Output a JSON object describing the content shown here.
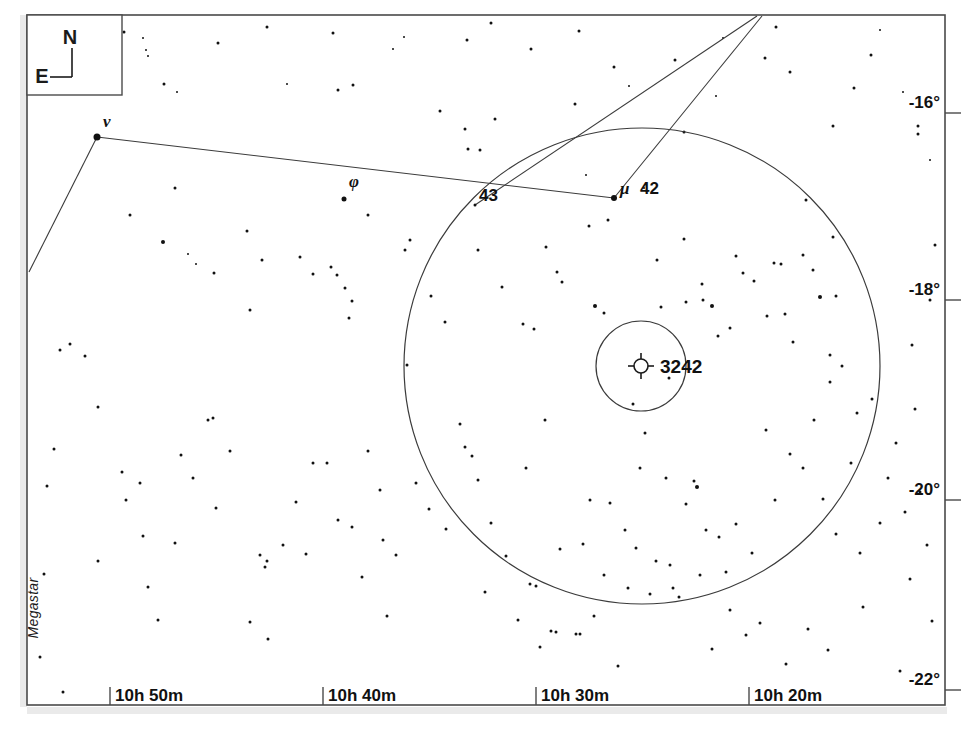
{
  "chart_data": {
    "type": "scatter",
    "title": "",
    "subtitle": "",
    "xlabel": "",
    "ylabel": "",
    "grid": false,
    "legend_position": "none",
    "projection": "equatorial star chart",
    "credit": "Megastar",
    "compass": {
      "north_label": "N",
      "east_label": "E"
    },
    "x_axis": {
      "kind": "right ascension",
      "tick_labels": [
        "10h 50m",
        "10h 40m",
        "10h 30m",
        "10h 20m"
      ],
      "tick_px": [
        110,
        323,
        536,
        749
      ],
      "range_labels": [
        "10h 55m",
        "10h 15m"
      ]
    },
    "y_axis": {
      "kind": "declination",
      "tick_labels": [
        "-16°",
        "-18°",
        "-20°",
        "-22°"
      ],
      "tick_px": [
        113,
        300,
        500,
        690
      ],
      "range_labels": [
        "-15°",
        "-22°"
      ]
    },
    "frame_px": {
      "left": 27,
      "top": 15,
      "right": 945,
      "bottom": 705
    },
    "labeled_objects": [
      {
        "label": "ν",
        "name": "nu",
        "x": 97,
        "y": 137,
        "size": 7,
        "label_dx": 6,
        "label_dy": -10,
        "font_size": 17,
        "italic": true
      },
      {
        "label": "φ",
        "name": "phi",
        "x": 344,
        "y": 199,
        "size": 5,
        "label_dx": 5,
        "label_dy": -12,
        "font_size": 17,
        "italic": true
      },
      {
        "label": "43",
        "name": "star-43",
        "x": 475,
        "y": 205,
        "size": 3,
        "label_dx": 4,
        "label_dy": -4,
        "font_size": 17,
        "italic": false
      },
      {
        "label": "μ",
        "name": "mu",
        "x": 614,
        "y": 198,
        "size": 6,
        "label_dx": 6,
        "label_dy": -4,
        "font_size": 17,
        "italic": true
      },
      {
        "label": "42",
        "name": "star-42",
        "x": 614,
        "y": 198,
        "size": 0,
        "label_dx": 26,
        "label_dy": -4,
        "font_size": 17,
        "italic": false
      },
      {
        "label": "3242",
        "name": "ngc-3242",
        "x": 641,
        "y": 366,
        "size": 0,
        "label_dx": 19,
        "label_dy": 7,
        "font_size": 19,
        "italic": false
      }
    ],
    "deep_sky_marker": {
      "label": "3242",
      "symbol": "planetary-nebula",
      "x": 641,
      "y": 366,
      "radius": 7,
      "tick_len": 6
    },
    "field_circles": [
      {
        "name": "outer-field-circle",
        "cx": 642,
        "cy": 366,
        "r": 238
      },
      {
        "name": "inner-field-circle",
        "cx": 641,
        "cy": 366,
        "r": 45
      }
    ],
    "constellation_lines": [
      {
        "name": "nu-to-mu",
        "points": [
          [
            97,
            137
          ],
          [
            614,
            198
          ]
        ]
      },
      {
        "name": "nu-to-southwest",
        "points": [
          [
            97,
            137
          ],
          [
            29,
            272
          ]
        ]
      },
      {
        "name": "mu-to-north",
        "points": [
          [
            614,
            198
          ],
          [
            762,
            16
          ]
        ]
      },
      {
        "name": "star43-to-north",
        "points": [
          [
            475,
            205
          ],
          [
            757,
            16
          ]
        ]
      }
    ],
    "stars": [
      [
        124,
        32,
        3
      ],
      [
        143,
        38,
        2
      ],
      [
        146,
        50,
        2
      ],
      [
        148,
        56,
        2
      ],
      [
        164,
        84,
        3
      ],
      [
        177,
        92,
        2
      ],
      [
        218,
        43,
        3
      ],
      [
        267,
        27,
        3
      ],
      [
        287,
        84,
        2
      ],
      [
        333,
        33,
        3
      ],
      [
        338,
        90,
        3
      ],
      [
        353,
        85,
        3
      ],
      [
        393,
        49,
        2
      ],
      [
        404,
        37,
        2
      ],
      [
        440,
        111,
        3
      ],
      [
        467,
        40,
        3
      ],
      [
        491,
        23,
        3
      ],
      [
        531,
        49,
        3
      ],
      [
        575,
        104,
        3
      ],
      [
        579,
        31,
        3
      ],
      [
        614,
        67,
        3
      ],
      [
        629,
        86,
        2
      ],
      [
        644,
        188,
        2
      ],
      [
        675,
        60,
        3
      ],
      [
        684,
        132,
        3
      ],
      [
        716,
        96,
        2
      ],
      [
        723,
        38,
        2
      ],
      [
        765,
        58,
        3
      ],
      [
        776,
        27,
        3
      ],
      [
        790,
        72,
        3
      ],
      [
        833,
        126,
        3
      ],
      [
        854,
        88,
        3
      ],
      [
        871,
        55,
        3
      ],
      [
        880,
        30,
        2
      ],
      [
        903,
        92,
        2
      ],
      [
        918,
        126,
        3
      ],
      [
        918,
        134,
        3
      ],
      [
        930,
        160,
        2
      ],
      [
        130,
        215,
        3
      ],
      [
        163,
        242,
        4
      ],
      [
        175,
        188,
        3
      ],
      [
        188,
        254,
        2
      ],
      [
        196,
        264,
        2
      ],
      [
        214,
        273,
        3
      ],
      [
        247,
        231,
        3
      ],
      [
        250,
        310,
        3
      ],
      [
        262,
        260,
        3
      ],
      [
        300,
        257,
        3
      ],
      [
        313,
        274,
        3
      ],
      [
        331,
        267,
        3
      ],
      [
        337,
        275,
        3
      ],
      [
        345,
        288,
        3
      ],
      [
        352,
        301,
        3
      ],
      [
        349,
        318,
        3
      ],
      [
        368,
        215,
        3
      ],
      [
        405,
        250,
        3
      ],
      [
        407,
        365,
        3
      ],
      [
        410,
        240,
        3
      ],
      [
        431,
        296,
        3
      ],
      [
        445,
        322,
        3
      ],
      [
        465,
        129,
        3
      ],
      [
        468,
        149,
        3
      ],
      [
        478,
        250,
        3
      ],
      [
        480,
        150,
        3
      ],
      [
        495,
        119,
        3
      ],
      [
        502,
        287,
        3
      ],
      [
        523,
        324,
        3
      ],
      [
        534,
        329,
        3
      ],
      [
        546,
        247,
        3
      ],
      [
        557,
        272,
        3
      ],
      [
        562,
        282,
        3
      ],
      [
        586,
        175,
        2
      ],
      [
        589,
        226,
        3
      ],
      [
        595,
        306,
        4
      ],
      [
        604,
        313,
        3
      ],
      [
        608,
        220,
        3
      ],
      [
        633,
        404,
        3
      ],
      [
        657,
        260,
        3
      ],
      [
        661,
        307,
        3
      ],
      [
        669,
        378,
        3
      ],
      [
        684,
        239,
        3
      ],
      [
        686,
        302,
        3
      ],
      [
        702,
        284,
        3
      ],
      [
        703,
        300,
        3
      ],
      [
        712,
        306,
        4
      ],
      [
        718,
        336,
        3
      ],
      [
        730,
        328,
        3
      ],
      [
        736,
        256,
        3
      ],
      [
        743,
        273,
        3
      ],
      [
        754,
        281,
        3
      ],
      [
        767,
        316,
        3
      ],
      [
        774,
        263,
        3
      ],
      [
        781,
        264,
        3
      ],
      [
        785,
        314,
        3
      ],
      [
        793,
        342,
        3
      ],
      [
        803,
        255,
        3
      ],
      [
        806,
        200,
        3
      ],
      [
        813,
        270,
        3
      ],
      [
        820,
        297,
        4
      ],
      [
        830,
        355,
        3
      ],
      [
        833,
        237,
        3
      ],
      [
        836,
        296,
        3
      ],
      [
        70,
        344,
        3
      ],
      [
        85,
        356,
        3
      ],
      [
        98,
        407,
        3
      ],
      [
        122,
        472,
        3
      ],
      [
        126,
        500,
        3
      ],
      [
        140,
        483,
        3
      ],
      [
        143,
        536,
        3
      ],
      [
        148,
        587,
        3
      ],
      [
        158,
        620,
        3
      ],
      [
        175,
        543,
        3
      ],
      [
        181,
        455,
        3
      ],
      [
        193,
        478,
        3
      ],
      [
        208,
        420,
        3
      ],
      [
        213,
        418,
        3
      ],
      [
        216,
        508,
        3
      ],
      [
        230,
        451,
        3
      ],
      [
        250,
        622,
        3
      ],
      [
        260,
        555,
        3
      ],
      [
        265,
        567,
        3
      ],
      [
        267,
        561,
        3
      ],
      [
        268,
        639,
        3
      ],
      [
        283,
        545,
        3
      ],
      [
        296,
        502,
        3
      ],
      [
        306,
        554,
        3
      ],
      [
        313,
        463,
        3
      ],
      [
        327,
        463,
        3
      ],
      [
        338,
        520,
        3
      ],
      [
        352,
        527,
        3
      ],
      [
        362,
        577,
        3
      ],
      [
        368,
        451,
        3
      ],
      [
        380,
        490,
        3
      ],
      [
        383,
        540,
        3
      ],
      [
        387,
        616,
        3
      ],
      [
        396,
        555,
        3
      ],
      [
        416,
        483,
        3
      ],
      [
        429,
        509,
        3
      ],
      [
        446,
        529,
        3
      ],
      [
        460,
        424,
        3
      ],
      [
        465,
        447,
        3
      ],
      [
        472,
        456,
        3
      ],
      [
        478,
        480,
        3
      ],
      [
        485,
        592,
        3
      ],
      [
        491,
        523,
        3
      ],
      [
        506,
        556,
        3
      ],
      [
        518,
        620,
        3
      ],
      [
        526,
        468,
        3
      ],
      [
        530,
        584,
        3
      ],
      [
        536,
        586,
        3
      ],
      [
        540,
        647,
        3
      ],
      [
        545,
        420,
        3
      ],
      [
        551,
        631,
        3
      ],
      [
        556,
        632,
        3
      ],
      [
        560,
        549,
        3
      ],
      [
        576,
        634,
        3
      ],
      [
        580,
        634,
        3
      ],
      [
        583,
        544,
        3
      ],
      [
        590,
        500,
        3
      ],
      [
        594,
        616,
        3
      ],
      [
        604,
        575,
        3
      ],
      [
        610,
        503,
        3
      ],
      [
        618,
        666,
        3
      ],
      [
        625,
        530,
        3
      ],
      [
        628,
        588,
        3
      ],
      [
        636,
        548,
        3
      ],
      [
        640,
        468,
        3
      ],
      [
        645,
        433,
        3
      ],
      [
        650,
        594,
        3
      ],
      [
        656,
        561,
        3
      ],
      [
        666,
        478,
        3
      ],
      [
        670,
        565,
        3
      ],
      [
        673,
        588,
        3
      ],
      [
        679,
        597,
        3
      ],
      [
        686,
        504,
        3
      ],
      [
        694,
        481,
        3
      ],
      [
        697,
        487,
        4
      ],
      [
        700,
        575,
        3
      ],
      [
        706,
        530,
        3
      ],
      [
        712,
        649,
        3
      ],
      [
        719,
        537,
        3
      ],
      [
        726,
        572,
        3
      ],
      [
        730,
        610,
        3
      ],
      [
        736,
        524,
        3
      ],
      [
        746,
        635,
        3
      ],
      [
        752,
        553,
        3
      ],
      [
        760,
        623,
        3
      ],
      [
        766,
        430,
        3
      ],
      [
        775,
        500,
        3
      ],
      [
        786,
        664,
        3
      ],
      [
        790,
        454,
        3
      ],
      [
        803,
        468,
        3
      ],
      [
        808,
        629,
        3
      ],
      [
        814,
        420,
        3
      ],
      [
        823,
        499,
        3
      ],
      [
        828,
        650,
        3
      ],
      [
        830,
        382,
        3
      ],
      [
        836,
        534,
        3
      ],
      [
        842,
        366,
        3
      ],
      [
        851,
        463,
        3
      ],
      [
        857,
        413,
        3
      ],
      [
        860,
        553,
        3
      ],
      [
        863,
        607,
        3
      ],
      [
        872,
        399,
        3
      ],
      [
        880,
        523,
        3
      ],
      [
        888,
        478,
        3
      ],
      [
        896,
        443,
        3
      ],
      [
        900,
        671,
        3
      ],
      [
        905,
        512,
        3
      ],
      [
        910,
        579,
        3
      ],
      [
        915,
        409,
        3
      ],
      [
        920,
        492,
        3
      ],
      [
        927,
        545,
        3
      ],
      [
        932,
        621,
        3
      ],
      [
        63,
        692,
        3
      ],
      [
        40,
        657,
        3
      ],
      [
        44,
        574,
        3
      ],
      [
        47,
        486,
        3
      ],
      [
        54,
        449,
        3
      ],
      [
        98,
        561,
        3
      ],
      [
        60,
        350,
        3
      ],
      [
        930,
        300,
        3
      ],
      [
        935,
        245,
        3
      ],
      [
        912,
        345,
        3
      ]
    ]
  }
}
